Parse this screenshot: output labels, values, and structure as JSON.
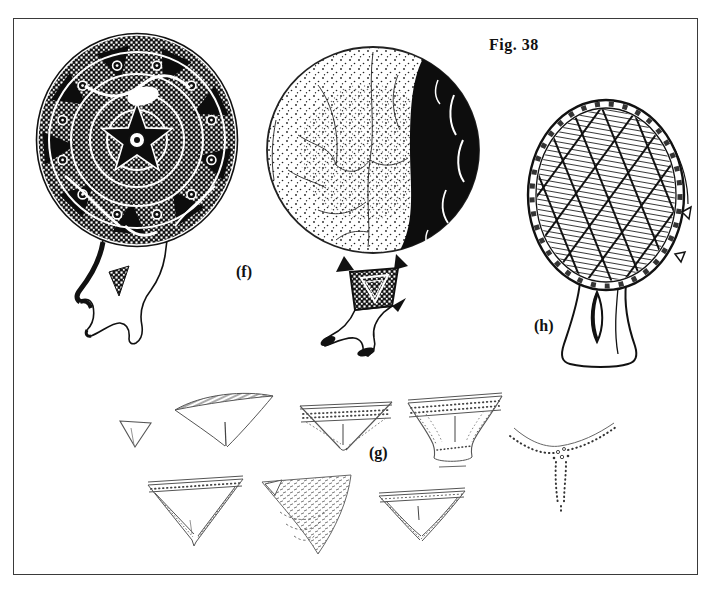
{
  "figure": {
    "title": "Fig. 38",
    "panels": [
      {
        "id": "f",
        "label": "(f)"
      },
      {
        "id": "g",
        "label": "(g)"
      },
      {
        "id": "h",
        "label": "(h)"
      }
    ]
  },
  "colors": {
    "ink": "#111111",
    "paper": "#ffffff"
  }
}
